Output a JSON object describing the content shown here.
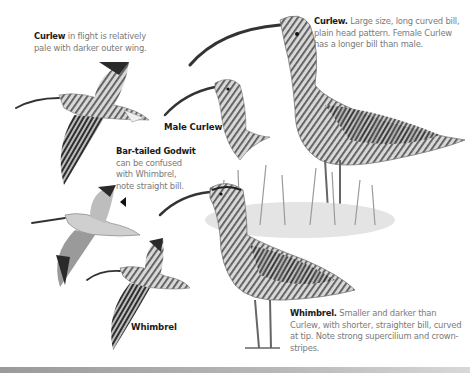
{
  "captions": {
    "curlew_flight": {
      "title": "Curlew",
      "text": " in flight is relatively pale with darker outer wing."
    },
    "curlew": {
      "title": "Curlew.",
      "text": " Large size, long curved bill, plain head pattern. Female Curlew has a longer bill than male."
    },
    "godwit": {
      "title": "Bar-tailed Godwit",
      "text": "can be confused with Whimbrel, note straight bill."
    },
    "whimbrel": {
      "title": "Whimbrel.",
      "text": " Smaller and darker than Curlew, with shorter, straighter bill, curved at tip. Note strong supercilium and crown-stripes."
    }
  },
  "labels": {
    "male_curlew": "Male Curlew",
    "whimbrel_flight": "Whimbrel"
  },
  "colors": {
    "title_text": "#1a1a1a",
    "body_text": "#7a7a7a",
    "bird_dark": "#3a3a3a",
    "bird_mid": "#8a8a8a",
    "bird_light": "#cfcfcf"
  }
}
